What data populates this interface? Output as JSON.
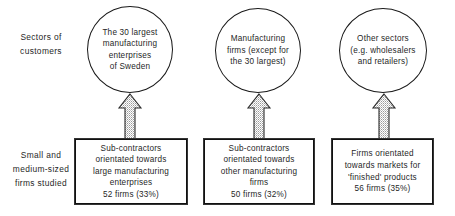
{
  "diagram": {
    "colors": {
      "ink": "#1a1a1a",
      "text": "#1f1f1f",
      "background": "#ffffff",
      "arrow_fill": "#d9d9d9",
      "arrow_outline": "#2b2b2b"
    },
    "row_labels": [
      {
        "name": "sectors-of-customers",
        "lines": [
          "Sectors of",
          "customers"
        ]
      },
      {
        "name": "small-and-medium-sized-firms-studied",
        "lines": [
          "Small and",
          "medium-sized",
          "firms studied"
        ]
      }
    ],
    "circles": [
      {
        "name": "the-30-largest-manufacturing-enterprises-of-sweden",
        "lines": [
          "The 30 largest",
          "manufacturing",
          "enterprises",
          "of Sweden"
        ]
      },
      {
        "name": "manufacturing-firms-except-for-the-30-largest",
        "lines": [
          "Manufacturing",
          "firms (except for",
          "the 30 largest)"
        ]
      },
      {
        "name": "other-sectors-wholesalers-and-retailers",
        "lines": [
          "Other sectors",
          "(e.g. wholesalers",
          "and retailers)"
        ]
      }
    ],
    "boxes": [
      {
        "name": "sub-contractors-large-manufacturing",
        "lines": [
          "Sub-contractors",
          "orientated  towards",
          "large manufacturing",
          "enterprises",
          "52 firms (33%)"
        ],
        "firm_count": 52,
        "share": "33%"
      },
      {
        "name": "sub-contractors-other-manufacturing",
        "lines": [
          "Sub-contractors",
          "orientated towards",
          "other manufacturing",
          "firms",
          "50 firms (32%)"
        ],
        "firm_count": 50,
        "share": "32%"
      },
      {
        "name": "firms-orientated-finished-products",
        "lines": [
          "Firms orientated",
          "towards markets for",
          "'finished' products",
          "56 firms (35%)"
        ],
        "firm_count": 56,
        "share": "35%"
      }
    ],
    "arrows": [
      {
        "name": "arrow-up-box1-to-circle1",
        "direction": "up"
      },
      {
        "name": "arrow-up-box2-to-circle2",
        "direction": "up"
      },
      {
        "name": "arrow-up-box3-to-circle3",
        "direction": "up"
      }
    ]
  }
}
